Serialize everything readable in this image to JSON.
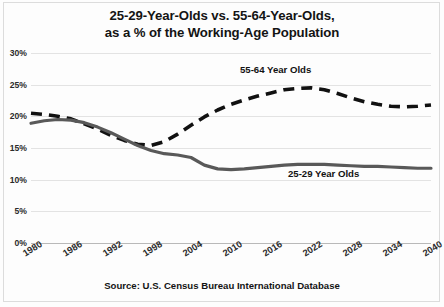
{
  "figure": {
    "clipped_top_text": "",
    "title_line1": "25-29-Year-Olds vs. 55-64-Year-Olds,",
    "title_line2": "as a % of the Working-Age Population",
    "source": "Source: U.S. Census Bureau International Database",
    "label_5564": "55-64 Year Olds",
    "label_2529": "25-29 Year Olds"
  },
  "chart_data": {
    "type": "line",
    "title": "25-29-Year-Olds vs. 55-64-Year-Olds, as a % of the Working-Age Population",
    "subtitle": "",
    "xlabel": "",
    "ylabel": "",
    "source": "Source: U.S. Census Bureau International Database",
    "xlim": [
      1980,
      2040
    ],
    "ylim": [
      0,
      30
    ],
    "ytick_labels": [
      "30%",
      "25%",
      "20%",
      "15%",
      "10%",
      "5%",
      "0%"
    ],
    "ytick_values": [
      30,
      25,
      20,
      15,
      10,
      5,
      0
    ],
    "xtick_labels": [
      "1980",
      "1986",
      "1992",
      "1998",
      "2004",
      "2010",
      "2016",
      "2022",
      "2028",
      "2034",
      "2040"
    ],
    "xtick_values": [
      1980,
      1986,
      1992,
      1998,
      2004,
      2010,
      2016,
      2022,
      2028,
      2034,
      2040
    ],
    "grid": true,
    "legend_position": "inline-annotations",
    "x": [
      1980,
      1982,
      1984,
      1986,
      1988,
      1990,
      1992,
      1994,
      1996,
      1998,
      2000,
      2002,
      2004,
      2006,
      2008,
      2010,
      2012,
      2014,
      2016,
      2018,
      2020,
      2022,
      2024,
      2026,
      2028,
      2030,
      2032,
      2034,
      2036,
      2038,
      2040
    ],
    "series": [
      {
        "name": "55-64 Year Olds",
        "style": "dashed",
        "color": "#111111",
        "values": [
          20.5,
          20.3,
          20.0,
          19.6,
          18.8,
          18.0,
          17.0,
          16.2,
          15.6,
          15.4,
          16.0,
          17.2,
          18.6,
          19.9,
          21.0,
          21.9,
          22.6,
          23.2,
          23.7,
          24.2,
          24.4,
          24.5,
          24.2,
          23.6,
          22.9,
          22.3,
          21.9,
          21.6,
          21.5,
          21.6,
          21.8
        ]
      },
      {
        "name": "25-29 Year Olds",
        "style": "solid",
        "color": "#595959",
        "values": [
          18.9,
          19.3,
          19.5,
          19.4,
          19.0,
          18.3,
          17.4,
          16.4,
          15.4,
          14.6,
          14.1,
          13.9,
          13.5,
          12.3,
          11.7,
          11.6,
          11.7,
          11.9,
          12.1,
          12.3,
          12.4,
          12.4,
          12.4,
          12.3,
          12.2,
          12.1,
          12.1,
          12.0,
          11.9,
          11.8,
          11.8
        ]
      }
    ]
  }
}
